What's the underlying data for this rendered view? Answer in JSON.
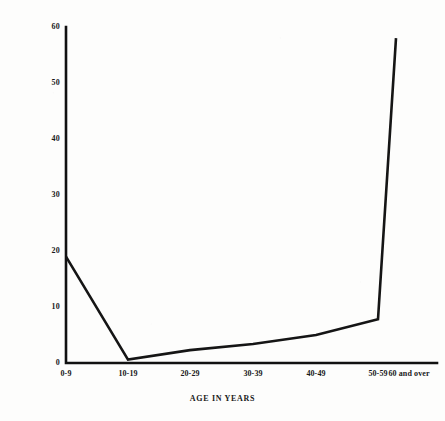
{
  "chart_data": {
    "type": "line",
    "title": "",
    "xlabel": "AGE IN YEARS",
    "ylabel": "PERCENTAGE",
    "categories": [
      "0-9",
      "10-19",
      "20-29",
      "30-39",
      "40-49",
      "50-59",
      "60 and over"
    ],
    "values": [
      19,
      0.6,
      2.3,
      3.4,
      5,
      7.8,
      58
    ],
    "series": [
      {
        "name": "Percentage",
        "values": [
          19,
          0.6,
          2.3,
          3.4,
          5,
          7.8,
          58
        ]
      }
    ],
    "ylim": [
      0,
      60
    ],
    "yticks": [
      0,
      10,
      20,
      30,
      40,
      50,
      60
    ],
    "ytick_labels": [
      "0",
      "10",
      "20",
      "30",
      "40",
      "50",
      "60"
    ],
    "grid": false,
    "legend": false,
    "legend_position": "none",
    "line_color": "#151515",
    "axis_color": "#111111",
    "background_color": "#fdfdfc"
  },
  "axes": {
    "y_title": "PERCENTAGE",
    "x_title": "AGE IN YEARS"
  }
}
